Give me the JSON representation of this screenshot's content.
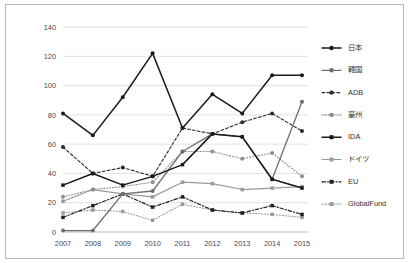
{
  "chart_data": {
    "type": "line",
    "title": "",
    "subtitle": "",
    "xlabel": "",
    "ylabel": "",
    "categories": [
      "2007",
      "2008",
      "2009",
      "2010",
      "2011",
      "2012",
      "2013",
      "2014",
      "2015"
    ],
    "x": [
      2007,
      2008,
      2009,
      2010,
      2011,
      2012,
      2013,
      2014,
      2015
    ],
    "ylim": [
      0,
      140
    ],
    "yticks": [
      0,
      20,
      40,
      60,
      80,
      100,
      120,
      140
    ],
    "ytick_labels": [
      "0",
      "20",
      "40",
      "60",
      "80",
      "100",
      "120",
      "140"
    ],
    "grid": "horizontal",
    "legend_position": "right",
    "series": [
      {
        "name": "日本",
        "color": "#1a1a1a",
        "line_style": "solid",
        "line_width": 1.5,
        "marker": "circle",
        "values": [
          81,
          66,
          92,
          122,
          71,
          94,
          81,
          107,
          107
        ]
      },
      {
        "name": "韓国",
        "color": "#6e6e6e",
        "line_style": "solid",
        "line_width": 1.3,
        "marker": "circle",
        "values": [
          1,
          1,
          26,
          28,
          55,
          67,
          65,
          36,
          89
        ]
      },
      {
        "name": "ADB",
        "color": "#2b2b2b",
        "line_style": "dashed",
        "line_width": 1.1,
        "marker": "circle",
        "values": [
          58,
          40,
          44,
          38,
          71,
          67,
          75,
          81,
          69
        ]
      },
      {
        "name": "豪州",
        "color": "#8c8c8c",
        "line_style": "dotted",
        "line_width": 1.1,
        "marker": "circle",
        "values": [
          24,
          29,
          31,
          34,
          55,
          55,
          50,
          54,
          38
        ]
      },
      {
        "name": "IDA",
        "color": "#1a1a1a",
        "line_style": "solid",
        "line_width": 1.5,
        "marker": "square",
        "values": [
          32,
          40,
          32,
          38,
          46,
          67,
          65,
          36,
          30
        ]
      },
      {
        "name": "ドイツ",
        "color": "#9a9a9a",
        "line_style": "solid",
        "line_width": 1.2,
        "marker": "square",
        "values": [
          21,
          29,
          26,
          24,
          34,
          33,
          29,
          30,
          31
        ]
      },
      {
        "name": "EU",
        "color": "#1f1f1f",
        "line_style": "dashdot",
        "line_width": 1.2,
        "marker": "square",
        "values": [
          10,
          18,
          26,
          17,
          24,
          15,
          13,
          18,
          12
        ]
      },
      {
        "name": "GlobalFund",
        "color": "#9a9a9a",
        "line_style": "dotted",
        "line_width": 1.1,
        "marker": "square",
        "values": [
          13,
          15,
          14,
          8,
          19,
          15,
          13,
          12,
          10
        ]
      }
    ]
  },
  "legend": {
    "items": [
      {
        "label": "日本"
      },
      {
        "label": "韓国"
      },
      {
        "label": "ADB"
      },
      {
        "label": "豪州"
      },
      {
        "label": "IDA"
      },
      {
        "label": "ドイツ"
      },
      {
        "label": "EU"
      },
      {
        "label": "GlobalFund"
      }
    ]
  },
  "colors": {
    "grid": "#d4d4d4",
    "axis": "#bdbdbd",
    "frame": "#b9b9b9",
    "tick_text": "#4a4a4a",
    "background": "#ffffff"
  }
}
